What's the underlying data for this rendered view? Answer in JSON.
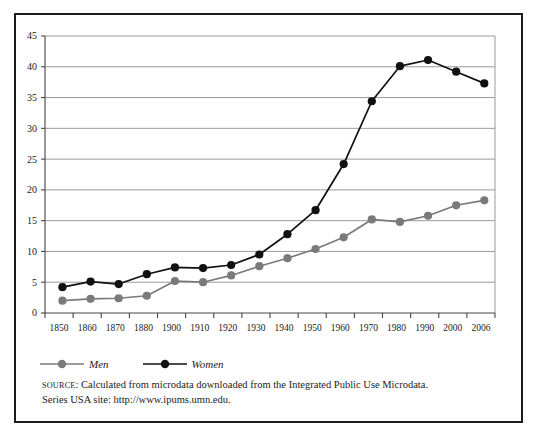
{
  "figure": {
    "source_prefix": "SOURCE",
    "source_line1": ": Calculated from microdata downloaded from the Integrated Public Use Microdata.",
    "source_line2": "Series USA site: http://www.ipums.umn.edu."
  },
  "legend": {
    "men_label": "Men",
    "women_label": "Women"
  },
  "colors": {
    "men": "#7a7a7a",
    "women": "#111111",
    "grid": "#8f8f8f",
    "axis": "#444444",
    "frame": "#1b1b1b",
    "background": "#ffffff"
  },
  "chart_data": {
    "type": "line",
    "title": "",
    "subtitle": "",
    "xlabel": "",
    "ylabel": "",
    "grid": true,
    "legend_position": "below-left",
    "categories": [
      "1850",
      "1860",
      "1870",
      "1880",
      "1900",
      "1910",
      "1920",
      "1930",
      "1940",
      "1950",
      "1960",
      "1970",
      "1980",
      "1990",
      "2000",
      "2006"
    ],
    "xtick_labels": [
      "1850",
      "1860",
      "1870",
      "1880",
      "1900",
      "1910",
      "1920",
      "1930",
      "1940",
      "1950",
      "1960",
      "1970",
      "1980",
      "1990",
      "2000",
      "2006"
    ],
    "ytick_labels": [
      "0",
      "5",
      "10",
      "15",
      "20",
      "25",
      "30",
      "35",
      "40",
      "45"
    ],
    "yticks": [
      0,
      5,
      10,
      15,
      20,
      25,
      30,
      35,
      40,
      45
    ],
    "ylim": [
      0,
      45
    ],
    "series": [
      {
        "name": "Men",
        "color": "#7a7a7a",
        "values": [
          2.0,
          2.3,
          2.4,
          2.8,
          5.2,
          5.0,
          6.1,
          7.6,
          8.9,
          10.4,
          12.3,
          15.2,
          14.8,
          15.8,
          17.5,
          18.3
        ]
      },
      {
        "name": "Women",
        "color": "#111111",
        "values": [
          4.2,
          5.1,
          4.7,
          6.3,
          7.4,
          7.3,
          7.8,
          9.5,
          12.8,
          16.7,
          24.2,
          34.4,
          40.1,
          41.1,
          39.2,
          37.3
        ]
      }
    ]
  }
}
